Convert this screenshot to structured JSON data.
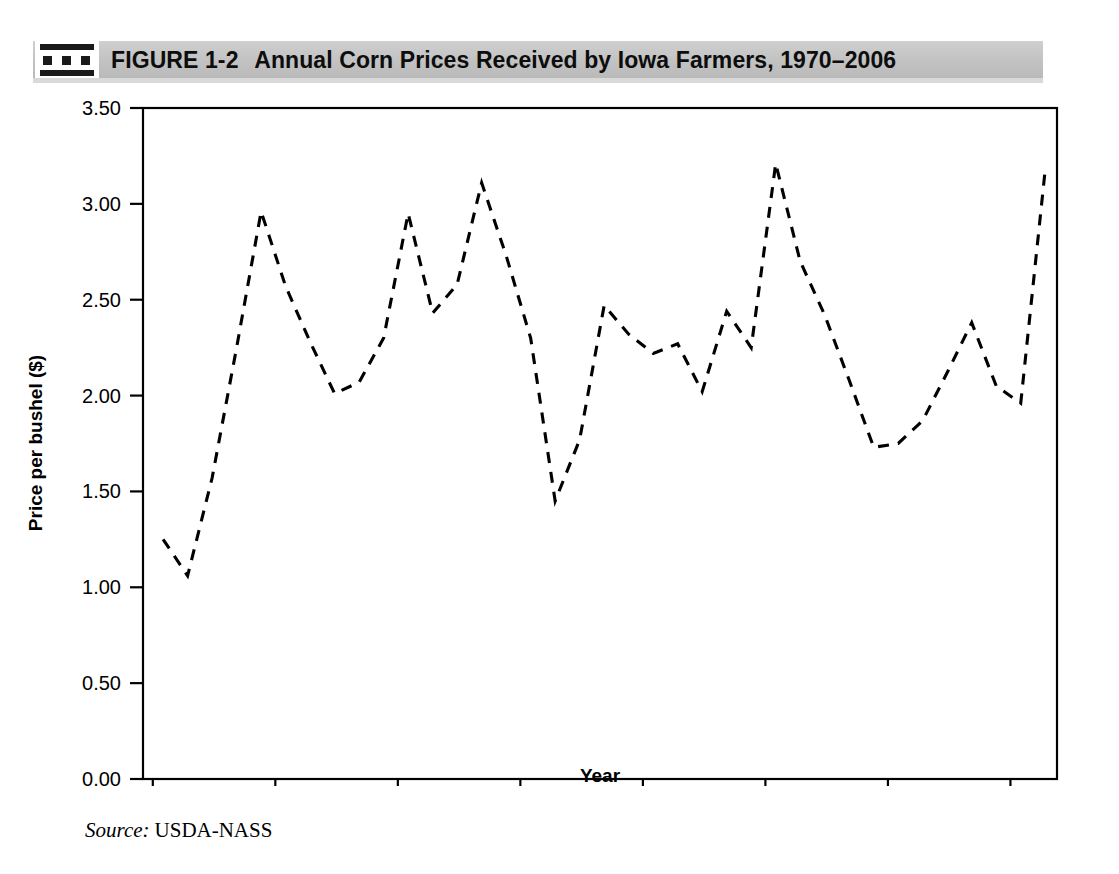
{
  "figure": {
    "icon": "filmstrip-icon",
    "number": "FIGURE 1-2",
    "caption": "Annual Corn Prices Received by Iowa Farmers, 1970–2006"
  },
  "source": {
    "label": "Source:",
    "value": "USDA-NASS"
  },
  "chart_data": {
    "type": "line",
    "xlabel": "Year",
    "ylabel": "Price per bushel ($)",
    "xlim": [
      1969.6,
      1006.0
    ],
    "ylim": [
      0.0,
      3.5
    ],
    "xticks": [
      1970,
      1975,
      1980,
      1985,
      1990,
      1995,
      2000,
      2005
    ],
    "xtick_labels": [
      "1970",
      "1975",
      "1980",
      "1985",
      "1990",
      "1995",
      "2000",
      "2005"
    ],
    "yticks": [
      0.0,
      0.5,
      1.0,
      1.5,
      2.0,
      2.5,
      3.0,
      3.5
    ],
    "ytick_labels": [
      "0.00",
      "0.50",
      "1.00",
      "1.50",
      "2.00",
      "2.50",
      "3.00",
      "3.50"
    ],
    "grid": false,
    "legend": null,
    "line_style": "dashed",
    "line_color": "#000000",
    "x": [
      1970,
      1971,
      1972,
      1973,
      1974,
      1975,
      1976,
      1977,
      1978,
      1979,
      1980,
      1981,
      1982,
      1983,
      1984,
      1985,
      1986,
      1987,
      1988,
      1989,
      1990,
      1991,
      1992,
      1993,
      1994,
      1995,
      1996,
      1997,
      1998,
      1999,
      2000,
      2001,
      2002,
      2003,
      2004,
      2005,
      2006
    ],
    "values": [
      1.25,
      1.06,
      1.57,
      2.25,
      2.96,
      2.57,
      2.28,
      2.01,
      2.07,
      2.3,
      2.95,
      2.43,
      2.58,
      3.11,
      2.73,
      2.3,
      1.45,
      1.77,
      2.47,
      2.32,
      2.22,
      2.27,
      2.02,
      2.44,
      2.25,
      3.21,
      2.7,
      2.42,
      2.08,
      1.73,
      1.75,
      1.87,
      2.12,
      2.38,
      2.05,
      1.96,
      3.18
    ],
    "series_name": "Price per bushel ($)",
    "units": "$ per bushel",
    "value_min": 1.06,
    "value_max": 3.21
  }
}
